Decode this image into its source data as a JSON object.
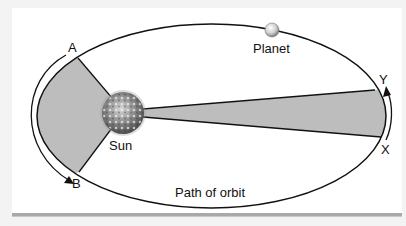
{
  "diagram": {
    "type": "kepler-second-law-equal-areas",
    "labels": {
      "point_a": "A",
      "point_b": "B",
      "point_x": "X",
      "point_y": "Y",
      "sun": "Sun",
      "planet": "Planet",
      "orbit": "Path of orbit"
    },
    "colors": {
      "sector_fill": "#bdbdbd",
      "line": "#111111",
      "background": "#ffffff",
      "frame": "#f3f3f3"
    }
  }
}
